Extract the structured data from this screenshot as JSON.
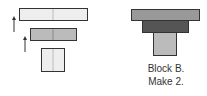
{
  "diagram": {
    "exploded_view": {
      "pieces": [
        {
          "name": "top-strip",
          "x": 19,
          "y": 8,
          "w": 68,
          "h": 12,
          "fill": "#eeeeee",
          "stroke": "#333333",
          "divider": true
        },
        {
          "name": "middle-strip",
          "x": 30,
          "y": 28,
          "w": 46,
          "h": 12,
          "fill": "#bbbbbb",
          "stroke": "#333333",
          "divider": true
        },
        {
          "name": "base-block",
          "x": 41,
          "y": 48,
          "w": 23,
          "h": 23,
          "fill": "#eeeeee",
          "stroke": "#333333",
          "divider": true
        }
      ],
      "arrows": [
        {
          "name": "assembly-arrow-1",
          "x": 14,
          "y1": 32,
          "y2": 17
        },
        {
          "name": "assembly-arrow-2",
          "x": 25,
          "y1": 52,
          "y2": 37
        }
      ]
    },
    "assembled_view": {
      "pieces": [
        {
          "name": "top-strip",
          "x": 131,
          "y": 9,
          "w": 68,
          "h": 11,
          "fill": "#999999"
        },
        {
          "name": "middle-strip",
          "x": 142,
          "y": 20,
          "w": 46,
          "h": 12,
          "fill": "#555555"
        },
        {
          "name": "base-block",
          "x": 153,
          "y": 32,
          "w": 23,
          "h": 23,
          "fill": "#bbbbbb"
        }
      ]
    },
    "caption": {
      "line1": "Block B.",
      "line2": "Make 2."
    }
  }
}
